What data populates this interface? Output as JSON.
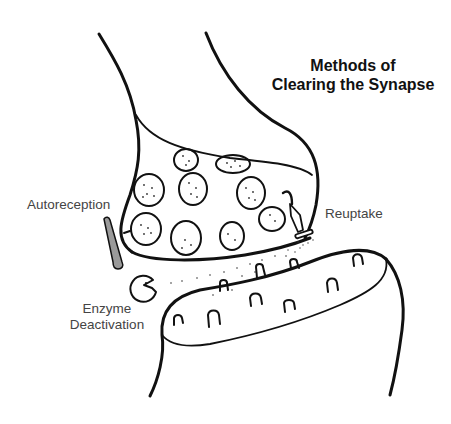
{
  "title": {
    "line1": "Methods of",
    "line2": "Clearing the Synapse"
  },
  "labels": {
    "autoreception": "Autoreception",
    "reuptake": "Reuptake",
    "enzyme_line1": "Enzyme",
    "enzyme_line2": "Deactivation"
  },
  "parts": [
    {
      "name": "presynaptic-terminal",
      "description": "axon terminal containing vesicles"
    },
    {
      "name": "synaptic-vesicles",
      "count": 10
    },
    {
      "name": "autoreceptor",
      "color": "#9a9a9a"
    },
    {
      "name": "reuptake-transporter"
    },
    {
      "name": "enzyme",
      "shape": "pac-man"
    },
    {
      "name": "postsynaptic-dendrite",
      "receptor_count": 9
    }
  ],
  "colors": {
    "line": "#111111",
    "label": "#444444",
    "autoreceptor_fill": "#9a9a9a",
    "background": "#ffffff"
  }
}
